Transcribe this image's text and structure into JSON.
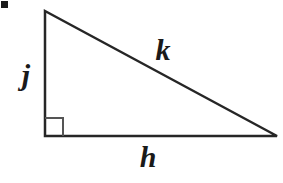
{
  "figure": {
    "background_color": "#ffffff",
    "stroke_color": "#262626",
    "stroke_width": 2.5,
    "width": 283,
    "height": 183,
    "bullet_marker": {
      "name": "bullet-square",
      "color": "#1a1a1a",
      "x": 1,
      "y": 1,
      "size": 7
    },
    "vertices": {
      "apex": {
        "x": 45,
        "y": 11
      },
      "right_angle": {
        "x": 45,
        "y": 136
      },
      "right": {
        "x": 277,
        "y": 136
      }
    },
    "right_angle_marker": {
      "name": "right-angle-square",
      "x": 45,
      "y": 118,
      "size": 18,
      "shown": true
    },
    "sides": [
      {
        "id": "vertical-leg",
        "label": "j",
        "from": "apex",
        "to": "right_angle",
        "label_x": 26,
        "label_y": 75
      },
      {
        "id": "hypotenuse",
        "label": "k",
        "from": "apex",
        "to": "right",
        "label_x": 163,
        "label_y": 50
      },
      {
        "id": "horizontal-leg",
        "label": "h",
        "from": "right_angle",
        "to": "right",
        "label_x": 148,
        "label_y": 157
      }
    ]
  }
}
